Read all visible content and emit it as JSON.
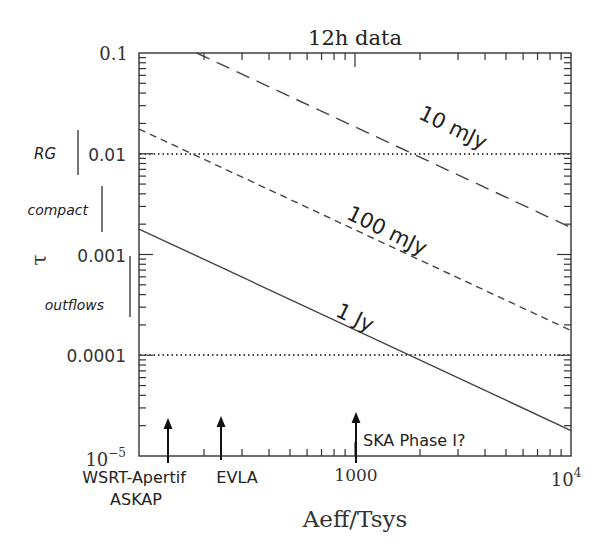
{
  "chart_data": {
    "type": "line",
    "title": "12h data",
    "xlabel": "Aeff/Tsys",
    "ylabel": "τ",
    "xscale": "log",
    "yscale": "log",
    "xlim": [
      100,
      10000
    ],
    "ylim": [
      1e-05,
      0.1
    ],
    "x_tick_labels": [
      {
        "value": 1000,
        "label": "1000"
      },
      {
        "value": 10000,
        "label": "10^4",
        "base": "10",
        "exp": "4"
      }
    ],
    "y_tick_labels": [
      {
        "value": 0.1,
        "label": "0.1"
      },
      {
        "value": 0.01,
        "label": "0.01"
      },
      {
        "value": 0.001,
        "label": "0.001"
      },
      {
        "value": 0.0001,
        "label": "0.0001"
      },
      {
        "value": 1e-05,
        "label": "10^-5",
        "base": "10",
        "exp": "−5"
      }
    ],
    "series": [
      {
        "name": "10 mJy",
        "style": "long-dash",
        "x": [
          185,
          10000
        ],
        "y": [
          0.1,
          0.00185
        ]
      },
      {
        "name": "100 mJy",
        "style": "short-dash",
        "x": [
          100,
          10000
        ],
        "y": [
          0.0176,
          0.000176
        ]
      },
      {
        "name": "1 Jy",
        "style": "solid",
        "x": [
          100,
          10000
        ],
        "y": [
          0.00179,
          1.79e-05
        ]
      }
    ],
    "reference_lines": [
      {
        "orientation": "horizontal",
        "y": 0.01,
        "style": "dotted"
      },
      {
        "orientation": "horizontal",
        "y": 0.0001,
        "style": "dotted"
      }
    ],
    "annotations": [
      {
        "type": "arrow",
        "x": 136,
        "label_lines": [
          "WSRT-Apertif",
          "ASKAP"
        ]
      },
      {
        "type": "arrow",
        "x": 240,
        "label_lines": [
          "EVLA"
        ]
      },
      {
        "type": "arrow",
        "x": 1000,
        "label_lines": [
          "SKA Phase I?"
        ]
      }
    ],
    "regions": [
      {
        "label": "RG",
        "y_range": [
          0.0046,
          0.0205
        ]
      },
      {
        "label": "compact",
        "y_range": [
          0.0016,
          0.0038
        ]
      },
      {
        "label": "outflows",
        "y_range": [
          0.00025,
          0.001
        ]
      }
    ],
    "grid": false,
    "legend": "inline labels on lines"
  }
}
